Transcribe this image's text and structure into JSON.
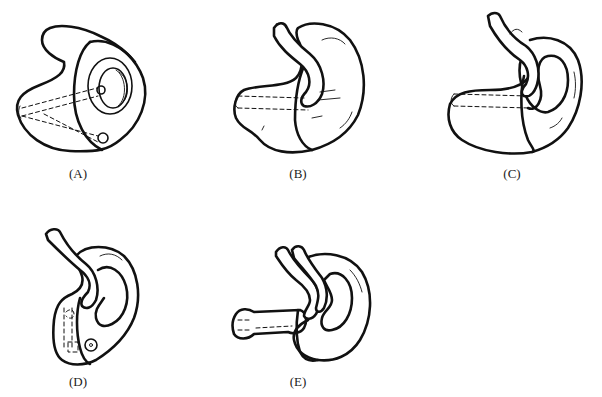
{
  "figure": {
    "panels": [
      {
        "id": "A",
        "label": "(A)",
        "description": "Ear mold with faceplate, sound bore opening and vent"
      },
      {
        "id": "B",
        "label": "(B)",
        "description": "Ear mold with tubing over helix, canal portion with dashed bore"
      },
      {
        "id": "C",
        "label": "(C)",
        "description": "Skeleton-style ear mold with tubing"
      },
      {
        "id": "D",
        "label": "(D)",
        "description": "Ear mold with tubing and vent, upright view"
      },
      {
        "id": "E",
        "label": "(E)",
        "description": "Ear mold with extended canal and dual tubing"
      }
    ]
  }
}
